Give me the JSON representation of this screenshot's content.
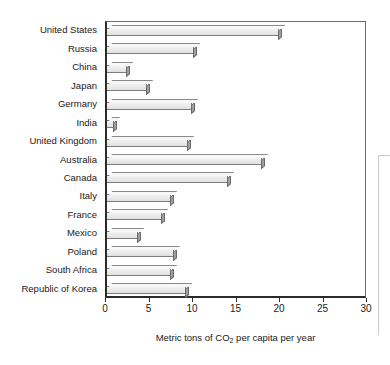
{
  "chart_data": {
    "type": "bar",
    "orientation": "horizontal",
    "title": "",
    "xlabel": "Metric tons of CO2 per capita per year",
    "xlabel_parts": {
      "before": "Metric tons of CO",
      "sub": "2",
      "after": " per capita per year"
    },
    "ylabel": "",
    "xlim": [
      0,
      30
    ],
    "xticks": [
      0,
      5,
      10,
      15,
      20,
      25,
      30
    ],
    "xtick_labels": [
      "0",
      "5",
      "10",
      "15",
      "20",
      "25",
      "30"
    ],
    "grid": false,
    "legend": null,
    "style": "3d-shaded-bars",
    "categories": [
      "United States",
      "Russia",
      "China",
      "Japan",
      "Germany",
      "India",
      "United Kingdom",
      "Australia",
      "Canada",
      "Italy",
      "France",
      "Mexico",
      "Poland",
      "South Africa",
      "Republic of Korea"
    ],
    "values": [
      20.1,
      10.3,
      2.6,
      4.9,
      10.1,
      1.2,
      9.7,
      18.2,
      14.3,
      7.7,
      6.7,
      3.9,
      8.0,
      7.7,
      9.4
    ]
  },
  "colors": {
    "bar_face": "#eaeaea",
    "bar_edge": "#7d7d7d",
    "bar_side": "#9e9e9e",
    "axis": "#2b2b2b",
    "text": "#1a1a1a",
    "background": "#ffffff"
  }
}
